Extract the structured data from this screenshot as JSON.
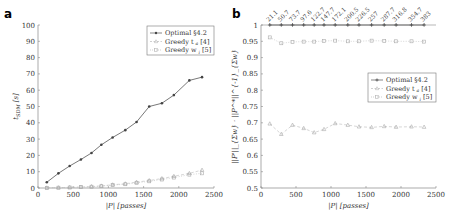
{
  "panels": [
    {
      "label": "a"
    },
    {
      "label": "b"
    }
  ],
  "chart_data": [
    {
      "panel": "a",
      "type": "line",
      "title": "",
      "xlabel": "|P| [passes]",
      "ylabel": "t_SDM [s]",
      "xlim": [
        0,
        2500
      ],
      "ylim": [
        0,
        100
      ],
      "xticks": [
        0,
        500,
        1000,
        1500,
        2000,
        2500
      ],
      "yticks": [
        0,
        10,
        20,
        30,
        40,
        50,
        60,
        70,
        80,
        90,
        100
      ],
      "legend_position": "upper right",
      "x": [
        125,
        290,
        450,
        610,
        760,
        900,
        1060,
        1240,
        1400,
        1580,
        1760,
        1930,
        2150,
        2330
      ],
      "series": [
        {
          "name": "Optimal §4.2",
          "marker": "dot",
          "style": "solid",
          "color": "#555555",
          "values": [
            3.5,
            9,
            13.5,
            17.5,
            21.5,
            26.5,
            31,
            35.5,
            40.5,
            50,
            52,
            57,
            66,
            68
          ]
        },
        {
          "name": "Greedy t_{a_i} [4]",
          "marker": "triangle",
          "style": "dashed",
          "color": "#bbbbbb",
          "values": [
            0.1,
            0.2,
            0.4,
            0.6,
            0.9,
            1.3,
            2,
            2.6,
            3.6,
            4.6,
            5.8,
            7.2,
            9,
            11
          ]
        },
        {
          "name": "Greedy w_i [5]",
          "marker": "square",
          "style": "dotted",
          "color": "#bbbbbb",
          "values": [
            0.1,
            0.2,
            0.3,
            0.5,
            0.8,
            1.1,
            1.8,
            2.3,
            3.2,
            4.1,
            5.2,
            6.4,
            8.2,
            9
          ]
        }
      ]
    },
    {
      "panel": "b",
      "type": "line",
      "title": "",
      "xlabel": "|P| [passes]",
      "ylabel": "||P'||_{Σw} · ||P^*||^{-1}_{Σw}",
      "xlim": [
        0,
        2500
      ],
      "ylim": [
        0.5,
        1
      ],
      "xticks": [
        0,
        500,
        1000,
        1500,
        2000,
        2500
      ],
      "yticks": [
        0.5,
        0.55,
        0.6,
        0.65,
        0.7,
        0.75,
        0.8,
        0.85,
        0.9,
        0.95,
        1
      ],
      "top_tick_labels": [
        "21.1",
        "50.7",
        "73.7",
        "97.6",
        "122.7",
        "147.7",
        "172.1",
        "200.5",
        "226.5",
        "257",
        "287.7",
        "316.8",
        "354.7",
        "383"
      ],
      "legend_position": "center right",
      "x": [
        125,
        290,
        450,
        610,
        760,
        900,
        1060,
        1240,
        1400,
        1580,
        1760,
        1930,
        2150,
        2330
      ],
      "series": [
        {
          "name": "Optimal §4.2",
          "marker": "plus",
          "style": "solid",
          "color": "#555555",
          "values": [
            1,
            1,
            1,
            1,
            1,
            1,
            1,
            1,
            1,
            1,
            1,
            1,
            1,
            1
          ]
        },
        {
          "name": "Greedy t_{a_i} [4]",
          "marker": "triangle",
          "style": "dashed",
          "color": "#bbbbbb",
          "values": [
            0.697,
            0.665,
            0.693,
            0.683,
            0.67,
            0.68,
            0.698,
            0.693,
            0.688,
            0.686,
            0.689,
            0.687,
            0.688,
            0.687
          ]
        },
        {
          "name": "Greedy w_i [5]",
          "marker": "square",
          "style": "dotted",
          "color": "#bbbbbb",
          "values": [
            0.962,
            0.944,
            0.948,
            0.949,
            0.949,
            0.951,
            0.952,
            0.95,
            0.95,
            0.952,
            0.951,
            0.95,
            0.95,
            0.949
          ]
        }
      ]
    }
  ],
  "legend": {
    "items": [
      "Optimal §4.2",
      "Greedy t",
      "Greedy w"
    ],
    "refs": [
      "§4.2",
      "[4]",
      "[5]"
    ]
  },
  "axes_text": {
    "xlabel": "|P| [passes]",
    "ylabel_a": "t",
    "ylabel_a_sub": "SDM",
    "ylabel_a_unit": "[s]"
  }
}
